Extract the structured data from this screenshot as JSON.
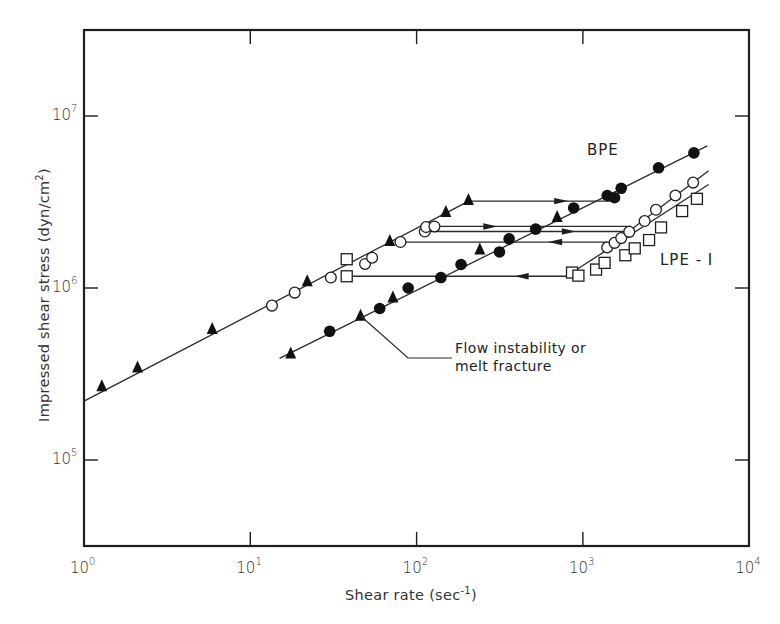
{
  "chart_data": {
    "type": "scatter",
    "title": "",
    "xlabel": "Shear rate (sec⁻¹)",
    "xlabel_base": "Shear rate (sec",
    "xlabel_sup": "-1",
    "xlabel_close": ")",
    "ylabel": "Impressed shear stress (dyn/cm²)",
    "ylabel_base": "Impressed shear stress (dyn/cm",
    "ylabel_sup": "2",
    "ylabel_close": ")",
    "xscale": "log",
    "yscale": "log",
    "xlim": [
      1,
      10000
    ],
    "ylim": [
      31600,
      32000000
    ],
    "grid": false,
    "legend": "none (inline series labels)",
    "x_ticks": [
      {
        "base": "10",
        "exp": "0"
      },
      {
        "base": "10",
        "exp": "1"
      },
      {
        "base": "10",
        "exp": "2"
      },
      {
        "base": "10",
        "exp": "3"
      },
      {
        "base": "10",
        "exp": "4"
      }
    ],
    "y_ticks": [
      {
        "base": "10",
        "exp": "5"
      },
      {
        "base": "10",
        "exp": "6"
      },
      {
        "base": "10",
        "exp": "7"
      }
    ],
    "series_labels": [
      {
        "text": "BPE"
      },
      {
        "text": "LPE - I"
      }
    ],
    "annotation": {
      "line1": "Flow instability or",
      "line2": "melt fracture"
    },
    "series": [
      {
        "name": "Filled triangles",
        "marker": "filled-triangle",
        "points": [
          [
            1.28,
            265000
          ],
          [
            2.1,
            340000
          ],
          [
            5.9,
            570000
          ],
          [
            22,
            1080000
          ],
          [
            69,
            1850000
          ],
          [
            150,
            2730000
          ],
          [
            205,
            3200000
          ],
          [
            17.5,
            410000
          ],
          [
            46,
            680000
          ],
          [
            72,
            870000
          ],
          [
            240,
            1650000
          ],
          [
            700,
            2550000
          ]
        ]
      },
      {
        "name": "Filled circles (BPE)",
        "marker": "filled-circle",
        "points": [
          [
            30,
            560000
          ],
          [
            60,
            760000
          ],
          [
            89,
            1000000
          ],
          [
            185,
            1370000
          ],
          [
            140,
            1150000
          ],
          [
            315,
            1620000
          ],
          [
            360,
            1930000
          ],
          [
            520,
            2200000
          ],
          [
            880,
            2920000
          ],
          [
            1400,
            3450000
          ],
          [
            1550,
            3350000
          ],
          [
            1700,
            3800000
          ],
          [
            2850,
            5000000
          ],
          [
            4650,
            6100000
          ]
        ]
      },
      {
        "name": "Open circles",
        "marker": "open-circle",
        "points": [
          [
            13.5,
            790000
          ],
          [
            18.5,
            940000
          ],
          [
            30.5,
            1150000
          ],
          [
            49,
            1380000
          ],
          [
            54,
            1500000
          ],
          [
            80,
            1850000
          ],
          [
            112,
            2130000
          ],
          [
            114,
            2260000
          ],
          [
            128,
            2280000
          ],
          [
            1400,
            1720000
          ],
          [
            1550,
            1830000
          ],
          [
            1700,
            1950000
          ],
          [
            1900,
            2120000
          ],
          [
            2350,
            2450000
          ],
          [
            2750,
            2850000
          ],
          [
            3600,
            3450000
          ],
          [
            4600,
            4100000
          ]
        ]
      },
      {
        "name": "Open squares (LPE-1)",
        "marker": "open-square",
        "points": [
          [
            38,
            1470000
          ],
          [
            38,
            1170000
          ],
          [
            860,
            1230000
          ],
          [
            940,
            1180000
          ],
          [
            1200,
            1280000
          ],
          [
            1350,
            1400000
          ],
          [
            1800,
            1550000
          ],
          [
            2050,
            1700000
          ],
          [
            2500,
            1900000
          ],
          [
            2950,
            2250000
          ],
          [
            3950,
            2800000
          ],
          [
            4850,
            3300000
          ]
        ]
      }
    ],
    "fitted_lines": [
      {
        "name": "Upper branch (low-rate, stable)",
        "from": [
          1,
          220000
        ],
        "to": [
          206,
          3200000
        ]
      },
      {
        "name": "BPE lower branch",
        "from": [
          15,
          390000
        ],
        "to": [
          5600,
          6700000
        ]
      },
      {
        "name": "Open circle high-rate branch",
        "from": [
          1350,
          1670000
        ],
        "to": [
          5700,
          4800000
        ]
      },
      {
        "name": "LPE-1 square high-rate branch",
        "from": [
          860,
          1230000
        ],
        "to": [
          5700,
          4000000
        ]
      }
    ],
    "jump_lines": [
      {
        "y": 3200000,
        "x_from": 206,
        "x_to": 1560,
        "arrow": "right",
        "arrow_x": 720
      },
      {
        "y": 2280000,
        "x_from": 128,
        "x_to": 1950,
        "arrow": "right",
        "arrow_x": 270
      },
      {
        "y": 2130000,
        "x_from": 112,
        "x_to": 2000,
        "arrow": "right",
        "arrow_x": 800
      },
      {
        "y": 1850000,
        "x_from": 80,
        "x_to": 1400,
        "arrow": "left",
        "arrow_x": 700
      },
      {
        "y": 1170000,
        "x_from": 38,
        "x_to": 860,
        "arrow": "left",
        "arrow_x": 440
      }
    ]
  }
}
